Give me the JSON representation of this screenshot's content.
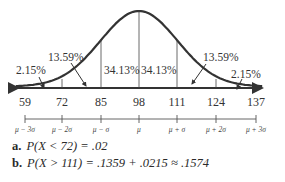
{
  "chart_data": {
    "type": "line",
    "title": "",
    "x_ticks": [
      59,
      72,
      85,
      98,
      111,
      124,
      137
    ],
    "sigma_labels": [
      "μ − 3σ",
      "μ − 2σ",
      "μ − σ",
      "μ",
      "μ + σ",
      "μ + 2σ",
      "μ + 3σ"
    ],
    "mean": 98,
    "sd": 13,
    "regions": [
      {
        "range": [
          59,
          72
        ],
        "label": "2.15%",
        "value": 2.15
      },
      {
        "range": [
          72,
          85
        ],
        "label": "13.59%",
        "value": 13.59
      },
      {
        "range": [
          85,
          98
        ],
        "label": "34.13%",
        "value": 34.13
      },
      {
        "range": [
          98,
          111
        ],
        "label": "34.13%",
        "value": 34.13
      },
      {
        "range": [
          111,
          124
        ],
        "label": "13.59%",
        "value": 13.59
      },
      {
        "range": [
          124,
          137
        ],
        "label": "2.15%",
        "value": 2.15
      }
    ],
    "xlim": [
      55,
      141
    ],
    "grid": false,
    "legend": "none"
  },
  "labels": {
    "left_tail": "2.15%",
    "left_mid": "13.59%",
    "center_left": "34.13%",
    "center_right": "34.13%",
    "right_mid": "13.59%",
    "right_tail": "2.15%"
  },
  "ticks": [
    "59",
    "72",
    "85",
    "98",
    "111",
    "124",
    "137"
  ],
  "sigma_axis": [
    "μ − 3σ",
    "μ − 2σ",
    "μ − σ",
    "μ",
    "μ + σ",
    "μ + 2σ",
    "μ + 3σ"
  ],
  "answers": [
    {
      "letter": "a.",
      "text": "P(X < 72) = .02"
    },
    {
      "letter": "b.",
      "text": "P(X > 111) = .1359 + .0215 ≈ .1574"
    }
  ]
}
